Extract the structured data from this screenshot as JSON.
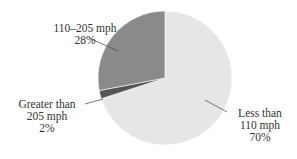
{
  "chart_data": {
    "type": "pie",
    "title": "",
    "categories": [
      "Less than 110 mph",
      "110–205 mph",
      "Greater than 205 mph"
    ],
    "values": [
      70,
      28,
      2
    ],
    "unit": "%",
    "colors": [
      "#e6e6e6",
      "#8a8a8a",
      "#555555"
    ],
    "labels": [
      {
        "line1": "Less than",
        "line2": "110 mph",
        "pct": "70%"
      },
      {
        "line1": "110–205 mph",
        "line2": "",
        "pct": "28%"
      },
      {
        "line1": "Greater than",
        "line2": "205 mph",
        "pct": "2%"
      }
    ],
    "legend": "none (leader-line labels)"
  }
}
